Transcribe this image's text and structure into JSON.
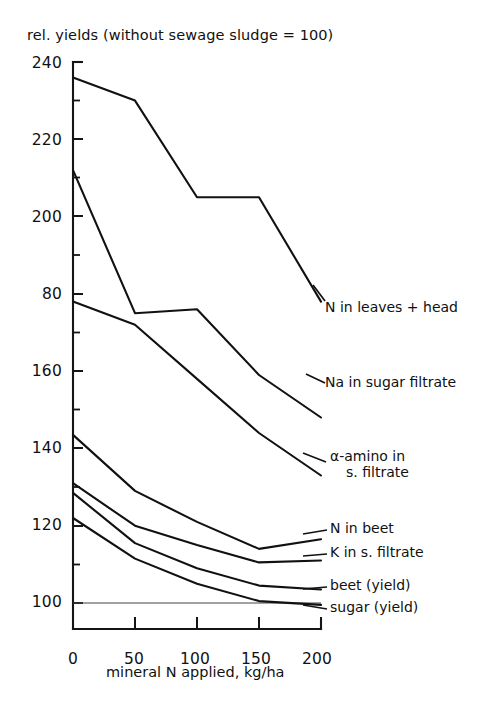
{
  "chart_data": {
    "type": "line",
    "title": "rel. yields (without sewage sludge = 100)",
    "xlabel": "mineral N applied, kg/ha",
    "ylabel": "",
    "x": [
      0,
      50,
      100,
      150,
      200
    ],
    "xlim": [
      0,
      200
    ],
    "ylim": [
      100,
      240
    ],
    "grid": false,
    "legend_position": "right-inline-labels",
    "xticks": [
      "0",
      "50",
      "100",
      "150",
      "200"
    ],
    "yticks": [
      "100",
      "120",
      "140",
      "160",
      "80",
      "200",
      "220",
      "240"
    ],
    "ytick_values": [
      100,
      120,
      140,
      160,
      180,
      200,
      220,
      240
    ],
    "minor_tick_step": 10,
    "reference_line": 100,
    "series": [
      {
        "name": "N in leaves + head",
        "label_lines": [
          "N in leaves + head"
        ],
        "values": [
          236,
          230,
          205,
          205,
          178
        ]
      },
      {
        "name": "Na in sugar filtrate",
        "label_lines": [
          "Na in sugar filtrate"
        ],
        "values": [
          212,
          175,
          176,
          159,
          148
        ]
      },
      {
        "name": "α-amino in s. filtrate",
        "label_lines": [
          "α-amino in",
          "s. filtrate"
        ],
        "values": [
          178,
          172,
          158,
          144,
          133
        ]
      },
      {
        "name": "N in beet",
        "label_lines": [
          "N in beet"
        ],
        "values": [
          143.5,
          129,
          121,
          114,
          116.5
        ]
      },
      {
        "name": "K in s. filtrate",
        "label_lines": [
          "K in s. filtrate"
        ],
        "values": [
          131,
          120,
          115,
          110.5,
          111
        ]
      },
      {
        "name": "beet (yield)",
        "label_lines": [
          "beet (yield)"
        ],
        "values": [
          128.5,
          115.5,
          109,
          104.5,
          103.5
        ]
      },
      {
        "name": "sugar (yield)",
        "label_lines": [
          "sugar (yield)"
        ],
        "values": [
          122,
          111.5,
          105,
          100.5,
          99.5
        ]
      }
    ]
  },
  "ytick_labels": {
    "t240": "240",
    "t220": "220",
    "t200": "200",
    "t180": "80",
    "t160": "160",
    "t140": "140",
    "t120": "120",
    "t100": "100"
  },
  "xtick_labels": {
    "t0": "0",
    "t50": "50",
    "t100": "100",
    "t150": "150",
    "t200": "200"
  },
  "labels": {
    "title": "rel. yields (without sewage sludge = 100)",
    "xaxis": "mineral N applied, kg/ha",
    "s1": "N in leaves + head",
    "s2": "Na in sugar filtrate",
    "s3a": "α-amino in",
    "s3b": "s. filtrate",
    "s4": "N in beet",
    "s5": "K in s. filtrate",
    "s6": "beet (yield)",
    "s7": "sugar (yield)"
  },
  "colors": {
    "ink": "#111111",
    "paper": "#ffffff"
  }
}
